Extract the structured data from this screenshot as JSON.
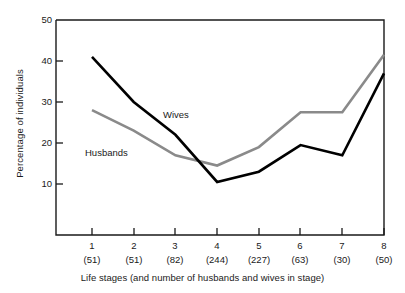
{
  "chart_data": {
    "type": "line",
    "title": "",
    "xlabel": "Life stages (and number of  husbands and wives in stage)",
    "ylabel": "Percentage of individuals",
    "categories": [
      "1",
      "2",
      "3",
      "4",
      "5",
      "6",
      "7",
      "8"
    ],
    "category_counts": [
      "(51)",
      "(51)",
      "(82)",
      "(244)",
      "(227)",
      "(63)",
      "(30)",
      "(50)"
    ],
    "x_tick_labels": [
      "1",
      "2",
      "3",
      "4",
      "5",
      "6",
      "7",
      "8"
    ],
    "y_tick_labels": [
      "10",
      "20",
      "30",
      "40",
      "50"
    ],
    "y_tick_values": [
      10,
      20,
      30,
      40,
      50
    ],
    "ylim": [
      0,
      50
    ],
    "xlim": [
      0.5,
      8.5
    ],
    "grid": false,
    "legend": "inline-annotations",
    "series": [
      {
        "name": "Wives",
        "color": "#000000",
        "values": [
          41,
          30,
          22,
          10.5,
          13,
          19.5,
          17,
          37
        ]
      },
      {
        "name": "Husbands",
        "color": "#8a8a8a",
        "values": [
          28,
          23,
          17,
          14.5,
          19,
          27.5,
          27.5,
          41.5
        ]
      }
    ],
    "annotations": [
      {
        "text": "Wives",
        "series": "Wives"
      },
      {
        "text": "Husbands",
        "series": "Husbands"
      }
    ]
  },
  "labels": {
    "y_axis_title": "Percentage of individuals",
    "x_axis_title": "Life stages (and number of  husbands and wives in stage)",
    "series_wives": "Wives",
    "series_husbands": "Husbands",
    "ytick_50": "50",
    "ytick_40": "40",
    "ytick_30": "30",
    "ytick_20": "20",
    "ytick_10": "10",
    "xtick_1": "1",
    "xtick_2": "2",
    "xtick_3": "3",
    "xtick_4": "4",
    "xtick_5": "5",
    "xtick_6": "6",
    "xtick_7": "7",
    "xtick_8": "8",
    "count_1": "(51)",
    "count_2": "(51)",
    "count_3": "(82)",
    "count_4": "(244)",
    "count_5": "(227)",
    "count_6": "(63)",
    "count_7": "(30)",
    "count_8": "(50)"
  },
  "colors": {
    "wives_line": "#000000",
    "husbands_line": "#8a8a8a",
    "axis": "#1a1a1a",
    "background": "#ffffff"
  }
}
